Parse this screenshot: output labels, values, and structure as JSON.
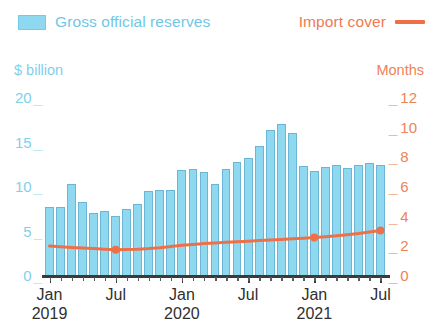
{
  "legend": {
    "bars_label": "Gross official reserves",
    "line_label": "Import cover",
    "bars_color": "#8ed9ef",
    "line_color": "#ef7047"
  },
  "axes": {
    "left_unit": "$ billion",
    "right_unit": "Months",
    "left_ticks": [
      "0",
      "5",
      "10",
      "15",
      "20"
    ],
    "right_ticks": [
      "0",
      "2",
      "4",
      "6",
      "8",
      "10",
      "12"
    ],
    "left_tick_dash": "_",
    "right_tick_dash": "_"
  },
  "x_axis": {
    "labels": [
      {
        "month": "Jan",
        "year": "2019"
      },
      {
        "month": "Jul",
        "year": ""
      },
      {
        "month": "Jan",
        "year": "2020"
      },
      {
        "month": "Jul",
        "year": ""
      },
      {
        "month": "Jan",
        "year": "2021"
      },
      {
        "month": "Jul",
        "year": ""
      }
    ]
  },
  "chart_data": {
    "type": "bar",
    "title": "",
    "xlabel": "",
    "ylabel": "$ billion",
    "y2label": "Months",
    "ylim": [
      0,
      20
    ],
    "y2lim": [
      0,
      12
    ],
    "grid": false,
    "legend_position": "top",
    "categories": [
      "Jan 2019",
      "Feb 2019",
      "Mar 2019",
      "Apr 2019",
      "May 2019",
      "Jun 2019",
      "Jul 2019",
      "Aug 2019",
      "Sep 2019",
      "Oct 2019",
      "Nov 2019",
      "Dec 2019",
      "Jan 2020",
      "Feb 2020",
      "Mar 2020",
      "Apr 2020",
      "May 2020",
      "Jun 2020",
      "Jul 2020",
      "Aug 2020",
      "Sep 2020",
      "Oct 2020",
      "Nov 2020",
      "Dec 2020",
      "Jan 2021",
      "Feb 2021",
      "Mar 2021",
      "Apr 2021",
      "May 2021",
      "Jun 2021",
      "Jul 2021"
    ],
    "series": [
      {
        "name": "Gross official reserves",
        "type": "bar",
        "axis": "left",
        "unit": "$ billion",
        "color": "#8ed9ef",
        "values": [
          7.6,
          7.6,
          10.2,
          8.2,
          7.0,
          7.2,
          6.6,
          7.4,
          8.0,
          9.4,
          9.6,
          9.6,
          11.8,
          11.9,
          11.6,
          10.2,
          11.9,
          12.7,
          13.2,
          14.5,
          16.3,
          17.0,
          16.0,
          12.2,
          11.7,
          12.1,
          12.4,
          12.0,
          12.4,
          12.6,
          12.4
        ]
      },
      {
        "name": "Import cover",
        "type": "line",
        "axis": "right",
        "unit": "Months",
        "color": "#ef7047",
        "markers_at": [
          "Jul 2019",
          "Jan 2021",
          "Jul 2021"
        ],
        "values": [
          1.95,
          1.9,
          1.86,
          1.82,
          1.78,
          1.74,
          1.7,
          1.72,
          1.74,
          1.78,
          1.84,
          1.92,
          2.0,
          2.06,
          2.12,
          2.16,
          2.2,
          2.24,
          2.28,
          2.32,
          2.36,
          2.4,
          2.44,
          2.48,
          2.52,
          2.58,
          2.64,
          2.72,
          2.8,
          2.9,
          3.0
        ]
      }
    ]
  }
}
